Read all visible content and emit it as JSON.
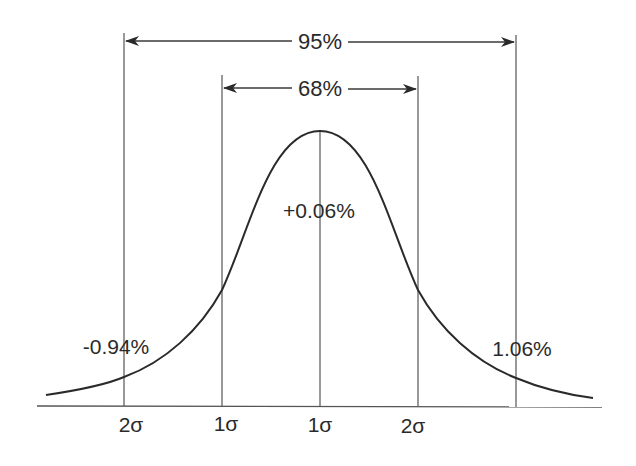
{
  "diagram": {
    "type": "normal-distribution",
    "colors": {
      "line": "#3a3a3a",
      "curve": "#2a2a2a",
      "text": "#2a2a2a",
      "background": "#ffffff"
    },
    "spans": [
      {
        "id": "span-95",
        "label": "95%",
        "from_sigma": -2,
        "to_sigma": 2
      },
      {
        "id": "span-68",
        "label": "68%",
        "from_sigma": -1,
        "to_sigma": 1
      }
    ],
    "values": {
      "mean": "+0.06%",
      "minus_2sigma": "-0.94%",
      "plus_2sigma": "1.06%"
    },
    "sigma_labels": [
      "2σ",
      "1σ",
      "1σ",
      "2σ"
    ]
  }
}
